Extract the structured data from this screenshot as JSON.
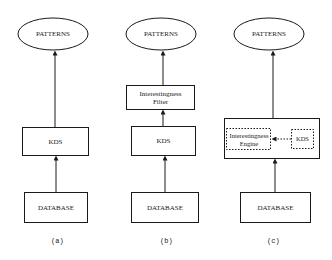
{
  "diagram": {
    "panels": [
      {
        "caption": "(a)",
        "nodes": {
          "patterns": "PATTERNS",
          "kds": "KDS",
          "database": "DATABASE"
        }
      },
      {
        "caption": "(b)",
        "nodes": {
          "patterns": "PATTERNS",
          "filter": "Interestingness Filter",
          "kds": "KDS",
          "database": "DATABASE"
        }
      },
      {
        "caption": "(c)",
        "nodes": {
          "patterns": "PATTERNS",
          "engine": "Interestingness Engine",
          "kds": "KDS",
          "database": "DATABASE"
        }
      }
    ],
    "edges": [
      {
        "panel": "a",
        "from": "DATABASE",
        "to": "KDS"
      },
      {
        "panel": "a",
        "from": "KDS",
        "to": "PATTERNS"
      },
      {
        "panel": "b",
        "from": "DATABASE",
        "to": "KDS"
      },
      {
        "panel": "b",
        "from": "KDS",
        "to": "Interestingness Filter"
      },
      {
        "panel": "b",
        "from": "Interestingness Filter",
        "to": "PATTERNS"
      },
      {
        "panel": "c",
        "from": "DATABASE",
        "to": "Interestingness Engine + KDS"
      },
      {
        "panel": "c",
        "from": "KDS",
        "to": "Interestingness Engine",
        "style": "dashed"
      },
      {
        "panel": "c",
        "from": "Interestingness Engine + KDS",
        "to": "PATTERNS"
      }
    ]
  }
}
